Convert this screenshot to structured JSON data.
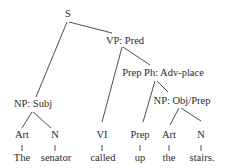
{
  "diagram": {
    "type": "syntax-tree",
    "nodes": {
      "s": "S",
      "vp": "VP: Pred",
      "prep_ph": "Prep Ph: Adv-place",
      "np_subj": "NP: Subj",
      "np_obj": "NP: Obj/Prep",
      "art1": "Art",
      "n1": "N",
      "vi": "VI",
      "prep": "Prep",
      "art2": "Art",
      "n2": "N"
    },
    "words": {
      "w1": "The",
      "w2": "senator",
      "w3": "called",
      "w4": "up",
      "w5": "the",
      "w6": "stairs."
    },
    "edges": [
      [
        "S",
        "NP: Subj"
      ],
      [
        "S",
        "VP: Pred"
      ],
      [
        "VP: Pred",
        "VI"
      ],
      [
        "VP: Pred",
        "Prep Ph: Adv-place"
      ],
      [
        "Prep Ph: Adv-place",
        "Prep"
      ],
      [
        "Prep Ph: Adv-place",
        "NP: Obj/Prep"
      ],
      [
        "NP: Obj/Prep",
        "Art"
      ],
      [
        "NP: Obj/Prep",
        "N"
      ],
      [
        "NP: Subj",
        "Art"
      ],
      [
        "NP: Subj",
        "N"
      ],
      [
        "Art",
        "The"
      ],
      [
        "N",
        "senator"
      ],
      [
        "VI",
        "called"
      ],
      [
        "Prep",
        "up"
      ],
      [
        "Art",
        "the"
      ],
      [
        "N",
        "stairs."
      ]
    ]
  }
}
